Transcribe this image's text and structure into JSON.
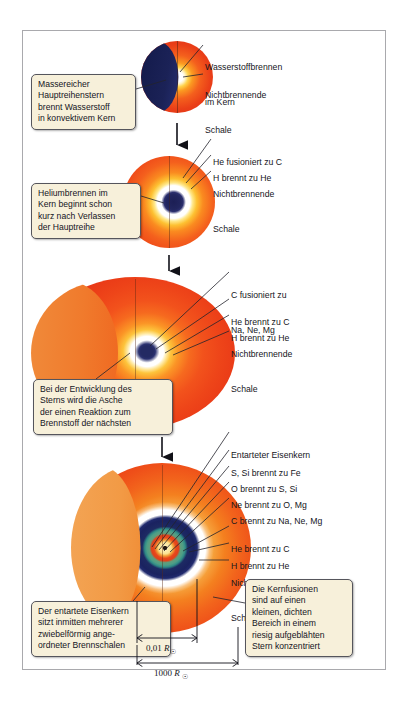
{
  "figure": {
    "background": "#ffffff",
    "frame_color": "#a9a9ad",
    "callout_fill": "#f7f0da",
    "callout_border": "#55555c",
    "text_color": "#16161c"
  },
  "stage1": {
    "callout": [
      "Massereicher",
      "Hauptreihenstern",
      "brennt Wasserstoff",
      "in konvektivem Kern"
    ],
    "labels": [
      {
        "lines": [
          "Wasserstoffbrennen",
          "im Kern"
        ]
      },
      {
        "lines": [
          "Nichtbrennende",
          "Schale"
        ]
      }
    ]
  },
  "stage2": {
    "callout": [
      "Heliumbrennen im",
      "Kern beginnt schon",
      "kurz nach Verlassen",
      "der Hauptreihe"
    ],
    "labels": [
      {
        "lines": [
          "He fusioniert zu C"
        ]
      },
      {
        "lines": [
          "H brennt zu He"
        ]
      },
      {
        "lines": [
          "Nichtbrennende",
          "Schale"
        ]
      }
    ]
  },
  "stage3": {
    "callout": [
      "Bei der Entwicklung des",
      "Sterns wird die Asche",
      "der einen Reaktion zum",
      "Brennstoff der nächsten"
    ],
    "labels": [
      {
        "lines": [
          "C fusioniert zu",
          "Na, Ne, Mg"
        ]
      },
      {
        "lines": [
          "He brennt zu C"
        ]
      },
      {
        "lines": [
          "H brennt zu He"
        ]
      },
      {
        "lines": [
          "Nichtbrennende",
          "Schale"
        ]
      }
    ]
  },
  "stage4": {
    "callout_left": [
      "Der entartete Eisenkern",
      "sitzt inmitten mehrerer",
      "zwiebelförmig ange-",
      "ordneter Brennschalen"
    ],
    "callout_right": [
      "Die Kernfusionen",
      "sind auf einen",
      "kleinen, dichten",
      "Bereich in einem",
      "riesig aufgeblähten",
      "Stern konzentriert"
    ],
    "labels": [
      {
        "lines": [
          "Entarteter Eisenkern"
        ]
      },
      {
        "lines": [
          "S, Si brennt zu Fe"
        ]
      },
      {
        "lines": [
          "O brennt zu S, Si"
        ]
      },
      {
        "lines": [
          "Ne brennt zu O, Mg"
        ]
      },
      {
        "lines": [
          "C brennt zu Na, Ne, Mg"
        ]
      },
      {
        "lines": [
          "He brennt zu C"
        ]
      },
      {
        "lines": [
          "H brennt zu He"
        ]
      },
      {
        "lines": [
          "Nichtbrennende",
          "Schale"
        ]
      }
    ],
    "scale_inner_value": "0,01",
    "scale_inner_unit": "R",
    "scale_inner_sub": "☉",
    "scale_outer_value": "1000",
    "scale_outer_unit": "R",
    "scale_outer_sub": "☉"
  }
}
